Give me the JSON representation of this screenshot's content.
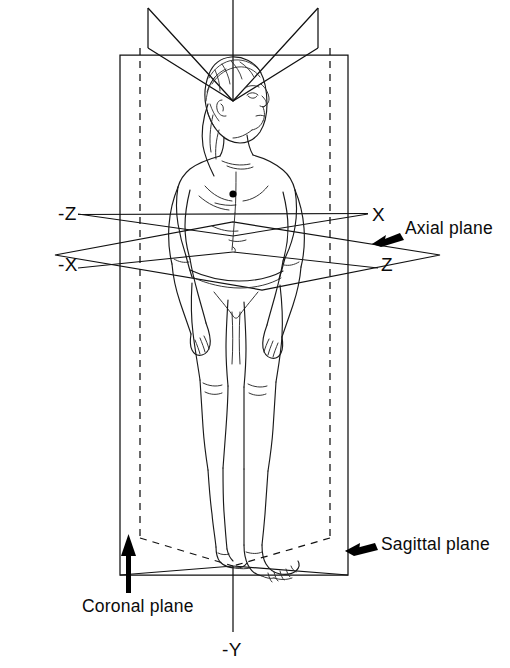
{
  "figure": {
    "background_color": "#ffffff",
    "line_color": "#111111",
    "arrow_color": "#000000"
  },
  "axis_labels": {
    "neg_z": "-Z",
    "x": "X",
    "neg_x": "-X",
    "z": "Z",
    "neg_y": "-Y"
  },
  "plane_labels": {
    "axial": "Axial plane",
    "sagittal": "Sagittal plane",
    "coronal": "Coronal plane"
  },
  "clipped_label": {
    "text": "l"
  },
  "planes": [
    {
      "name": "axial",
      "label": "Axial plane",
      "orientation": "horizontal",
      "style": "solid-parallelogram",
      "pointer_arrow": "left"
    },
    {
      "name": "sagittal",
      "label": "Sagittal plane",
      "orientation": "vertical-receding",
      "style": "dashed-hidden-edges",
      "pointer_arrow": "left"
    },
    {
      "name": "coronal",
      "label": "Coronal plane",
      "orientation": "vertical-frontal",
      "style": "solid-rectangle",
      "pointer_arrow": "up"
    }
  ],
  "figure_subject": {
    "name": "human-figure",
    "pose": "standing upright, anatomical position, head turned to viewer's right",
    "rendering": "black line art, no fill"
  }
}
